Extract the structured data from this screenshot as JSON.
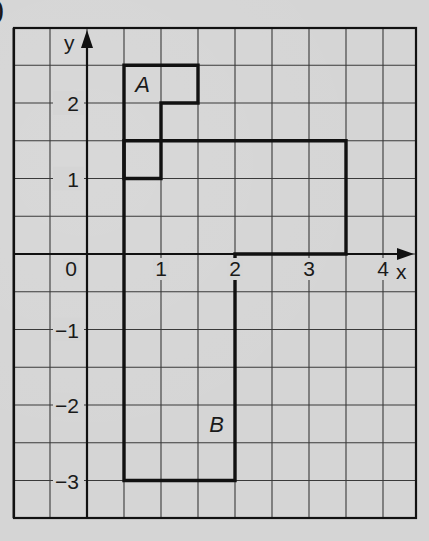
{
  "header": {
    "part_marker": ")"
  },
  "axes": {
    "x_label": "x",
    "y_label": "y",
    "x_ticks": [
      {
        "value": 0,
        "label": "0"
      },
      {
        "value": 1,
        "label": "1"
      },
      {
        "value": 2,
        "label": "2"
      },
      {
        "value": 3,
        "label": "3"
      },
      {
        "value": 4,
        "label": "4"
      }
    ],
    "y_ticks": [
      {
        "value": 2,
        "label": "2"
      },
      {
        "value": 1,
        "label": "1"
      },
      {
        "value": -1,
        "label": "−1"
      },
      {
        "value": -2,
        "label": "−2"
      },
      {
        "value": -3,
        "label": "−3"
      }
    ],
    "x_range": [
      -1,
      4.5
    ],
    "y_range": [
      -3.5,
      3
    ],
    "grid_step": 0.5
  },
  "shapes": [
    {
      "name": "A",
      "label": "A",
      "label_pos": [
        0.75,
        2.25
      ],
      "vertices": [
        [
          0.5,
          2.5
        ],
        [
          1.5,
          2.5
        ],
        [
          1.5,
          2
        ],
        [
          1,
          2
        ],
        [
          1,
          1
        ],
        [
          0.5,
          1
        ],
        [
          0.5,
          2.5
        ]
      ]
    },
    {
      "name": "B",
      "label": "B",
      "label_pos": [
        1.75,
        -2.25
      ],
      "vertices": [
        [
          0.5,
          1.5
        ],
        [
          3.5,
          1.5
        ],
        [
          3.5,
          0
        ],
        [
          2,
          0
        ],
        [
          2,
          -3
        ],
        [
          0.5,
          -3
        ],
        [
          0.5,
          1.5
        ]
      ]
    }
  ],
  "colors": {
    "paper": "#d5d5d5",
    "grid": "#3a3a3a",
    "ink": "#111111"
  }
}
